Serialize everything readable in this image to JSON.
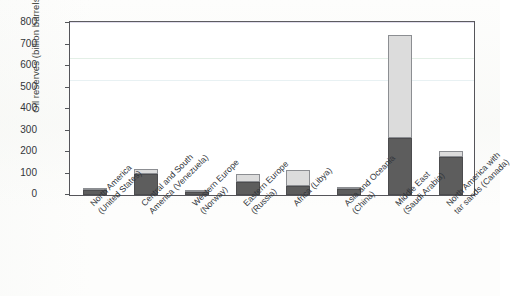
{
  "chart_data": {
    "type": "bar",
    "subtype": "stacked-bar",
    "title": "",
    "xlabel": "",
    "ylabel": "Oil reserves (billion barrels)",
    "ylim": [
      0,
      800
    ],
    "yticks": [
      0,
      100,
      200,
      300,
      400,
      500,
      600,
      700,
      800
    ],
    "ytick_labels": [
      "0",
      "100",
      "200",
      "300",
      "400",
      "500",
      "600",
      "700",
      "800"
    ],
    "grid": false,
    "legend": "none",
    "categories": [
      "North America (United States)",
      "Central and South America (Venezuela)",
      "Western Europe (Norway)",
      "Eastern Europe (Russia)",
      "Africa (Libya)",
      "Asia and Oceania (China)",
      "Middle East (Saudi Arabia)",
      "North America with tar sands (Canada)"
    ],
    "category_lines": [
      [
        "North America",
        "(United States)"
      ],
      [
        "Central and South",
        "America (Venezuela)"
      ],
      [
        "Western Europe",
        "(Norway)"
      ],
      [
        "Eastern Europe",
        "(Russia)"
      ],
      [
        "Africa (Libya)",
        ""
      ],
      [
        "Asia and Oceania",
        "(China)"
      ],
      [
        "Middle East",
        "(Saudi Arabia)"
      ],
      [
        "North America with",
        "tar sands (Canada)"
      ]
    ],
    "series": [
      {
        "name": "Proven reserves",
        "color": "#5d5d5d",
        "values": [
          22,
          100,
          13,
          60,
          42,
          26,
          263,
          178
        ]
      },
      {
        "name": "Additional reserves",
        "color": "#dcdcdc",
        "values": [
          9,
          19,
          2,
          36,
          74,
          7,
          482,
          28
        ]
      }
    ],
    "totals": [
      31,
      119,
      15,
      96,
      116,
      33,
      745,
      206
    ]
  },
  "colors": {
    "proven": "#5d5d5d",
    "potential": "#dcdcdc",
    "axis": "#55555a",
    "text": "#31353b",
    "page": "#fdfdfc"
  }
}
